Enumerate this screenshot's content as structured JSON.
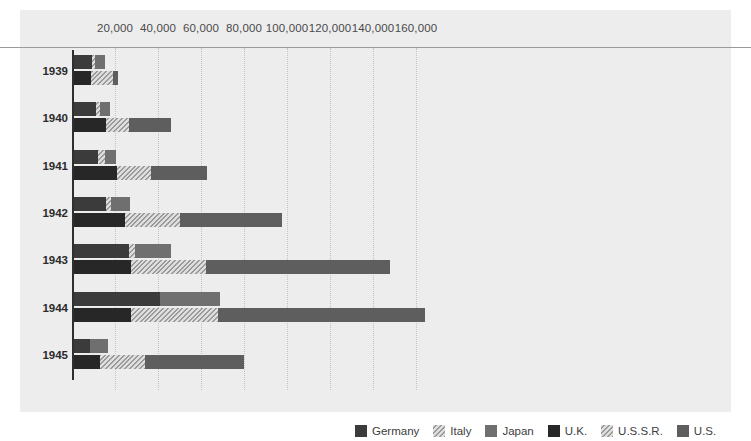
{
  "chart_data": {
    "type": "bar",
    "title": "",
    "subtitle": "",
    "xlabel": "",
    "ylabel": "",
    "orientation": "horizontal",
    "grouped_bars_per_category": 2,
    "grid": true,
    "legend_position": "bottom-right",
    "xlim": [
      0,
      175000
    ],
    "xticks": [
      20000,
      40000,
      60000,
      80000,
      100000,
      120000,
      140000,
      160000
    ],
    "xtick_labels": [
      "20,000",
      "40,000",
      "60,000",
      "80,000",
      "100,000",
      "120,000",
      "140,000",
      "160,000"
    ],
    "categories": [
      "1939",
      "1940",
      "1941",
      "1942",
      "1943",
      "1944",
      "1945"
    ],
    "series": [
      {
        "name": "Germany",
        "group": "Axis",
        "color": "#3b3b3b",
        "pattern": "solid",
        "values": [
          8300,
          10200,
          11000,
          14700,
          25500,
          39800,
          7500
        ]
      },
      {
        "name": "Italy",
        "group": "Axis",
        "color": "#d9d9d9",
        "pattern": "hatched",
        "values": [
          1700,
          1800,
          3500,
          2400,
          2800,
          0,
          0
        ]
      },
      {
        "name": "Japan",
        "group": "Axis",
        "color": "#6f6f6f",
        "pattern": "solid",
        "values": [
          4500,
          4800,
          5100,
          8900,
          16700,
          28200,
          8300
        ]
      },
      {
        "name": "U.K.",
        "group": "Allies",
        "color": "#272727",
        "pattern": "solid",
        "values": [
          7900,
          15000,
          20100,
          23700,
          26300,
          26500,
          12000
        ]
      },
      {
        "name": "U.S.S.R.",
        "group": "Allies",
        "color": "#d9d9d9",
        "pattern": "hatched",
        "values": [
          10400,
          10600,
          15700,
          25400,
          34900,
          40300,
          20900
        ]
      },
      {
        "name": "U.S.",
        "group": "Allies",
        "color": "#5e5e5e",
        "pattern": "solid",
        "values": [
          2100,
          19400,
          26300,
          47800,
          85900,
          96300,
          46300
        ]
      }
    ],
    "group_totals": {
      "Axis": [
        14500,
        16800,
        19600,
        26000,
        45000,
        68000,
        15800
      ],
      "Allies": [
        20400,
        45000,
        62100,
        96900,
        147100,
        163100,
        79200
      ]
    }
  },
  "legend": {
    "items": [
      {
        "label": "Germany",
        "swatch": "germany"
      },
      {
        "label": "Italy",
        "swatch": "italy"
      },
      {
        "label": "Japan",
        "swatch": "japan"
      },
      {
        "label": "U.K.",
        "swatch": "uk"
      },
      {
        "label": "U.S.S.R.",
        "swatch": "ussr"
      },
      {
        "label": "U.S.",
        "swatch": "us"
      }
    ]
  }
}
